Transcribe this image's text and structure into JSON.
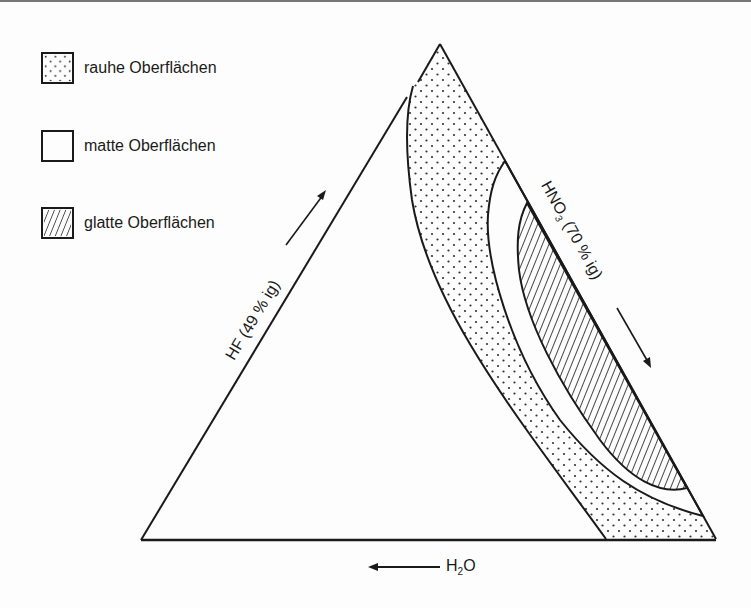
{
  "legend": {
    "items": [
      {
        "label": "rauhe Oberflächen",
        "pattern": "dots"
      },
      {
        "label": "matte Oberflächen",
        "pattern": "plain"
      },
      {
        "label": "glatte Oberflächen",
        "pattern": "hatch"
      }
    ]
  },
  "axes": {
    "left": {
      "prefix": "HF (49 % ig)",
      "direction": "up"
    },
    "right": {
      "prefix": "HNO",
      "sub": "3",
      "suffix": " (70 % ig)",
      "direction": "down"
    },
    "bottom": {
      "prefix": "H",
      "sub": "2",
      "suffix": "O",
      "direction": "left"
    }
  },
  "colors": {
    "line": "#1a1a1a",
    "background": "#fdfdfd"
  }
}
